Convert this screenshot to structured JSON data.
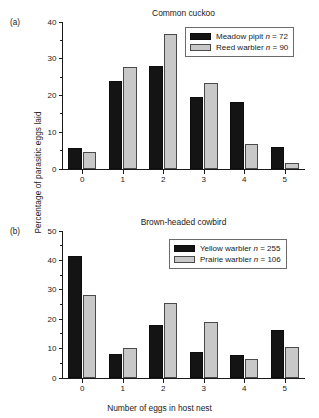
{
  "figure": {
    "xlabel": "Number of eggs in host nest",
    "ylabel": "Percentage of parasitic eggs laid"
  },
  "panels": [
    {
      "tag": "(a)",
      "title": "Common cuckoo",
      "ylim_max": 40,
      "yticks": [
        "0",
        "10",
        "20",
        "30",
        "40"
      ],
      "xticks": [
        "0",
        "1",
        "2",
        "3",
        "4",
        "5"
      ],
      "legend": [
        {
          "species": "Meadow pipit",
          "n_prefix": "n",
          "n_value": "= 72",
          "color": "#141414"
        },
        {
          "species": "Reed warbler",
          "n_prefix": "n",
          "n_value": "= 90",
          "color": "#c8c8c8"
        }
      ]
    },
    {
      "tag": "(b)",
      "title": "Brown-headed cowbird",
      "ylim_max": 50,
      "yticks": [
        "0",
        "10",
        "20",
        "30",
        "40",
        "50"
      ],
      "xticks": [
        "0",
        "1",
        "2",
        "3",
        "4",
        "5"
      ],
      "legend": [
        {
          "species": "Yellow warbler",
          "n_prefix": "n",
          "n_value": "= 255",
          "color": "#141414"
        },
        {
          "species": "Prairie warbler",
          "n_prefix": "n",
          "n_value": "= 106",
          "color": "#c8c8c8"
        }
      ]
    }
  ],
  "chart_data": [
    {
      "type": "bar",
      "title": "Common cuckoo",
      "panel": "(a)",
      "categories": [
        "0",
        "1",
        "2",
        "3",
        "4",
        "5"
      ],
      "xlabel": "Number of eggs in host nest",
      "ylabel": "Percentage of parasitic eggs laid",
      "ylim": [
        0,
        40
      ],
      "ytick_step": 10,
      "grid": false,
      "legend_position": "top-right",
      "series": [
        {
          "name": "Meadow pipit n = 72",
          "color": "#141414",
          "values": [
            5.6,
            23.9,
            27.9,
            19.6,
            18.3,
            5.9
          ]
        },
        {
          "name": "Reed warbler n = 90",
          "color": "#c8c8c8",
          "values": [
            4.6,
            27.8,
            36.7,
            23.4,
            6.8,
            1.7
          ]
        }
      ]
    },
    {
      "type": "bar",
      "title": "Brown-headed cowbird",
      "panel": "(b)",
      "categories": [
        "0",
        "1",
        "2",
        "3",
        "4",
        "5"
      ],
      "xlabel": "Number of eggs in host nest",
      "ylabel": "Percentage of parasitic eggs laid",
      "ylim": [
        0,
        50
      ],
      "ytick_step": 10,
      "grid": false,
      "legend_position": "top-right",
      "series": [
        {
          "name": "Yellow warbler n = 255",
          "color": "#141414",
          "values": [
            41.4,
            8.3,
            18.1,
            8.9,
            7.9,
            16.2
          ]
        },
        {
          "name": "Prairie warbler n = 106",
          "color": "#c8c8c8",
          "values": [
            28.2,
            10.3,
            25.4,
            19.0,
            6.5,
            10.4
          ]
        }
      ]
    }
  ]
}
